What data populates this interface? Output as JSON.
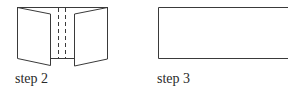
{
  "figure": {
    "steps": [
      {
        "id": "step-2",
        "label": "step 2",
        "description": "paper with two side flaps folded outward, two dashed fold lines in the center"
      },
      {
        "id": "step-3",
        "label": "step 3",
        "description": "flat closed rectangle"
      }
    ],
    "colors": {
      "line": "#3a3a3a",
      "background": "#ffffff",
      "text": "#2a2a2a"
    }
  }
}
